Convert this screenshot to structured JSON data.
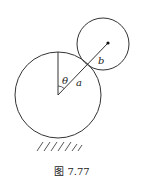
{
  "figure": {
    "caption": "图 7.77",
    "labels": {
      "theta": "θ",
      "a": "a",
      "b": "b"
    },
    "big_circle": {
      "cx": 58,
      "cy": 95,
      "r": 43
    },
    "small_circle": {
      "cx": 103,
      "cy": 44,
      "r": 26
    },
    "small_center_dot": {
      "cx": 108,
      "cy": 43
    },
    "stroke_color": "#333333"
  }
}
